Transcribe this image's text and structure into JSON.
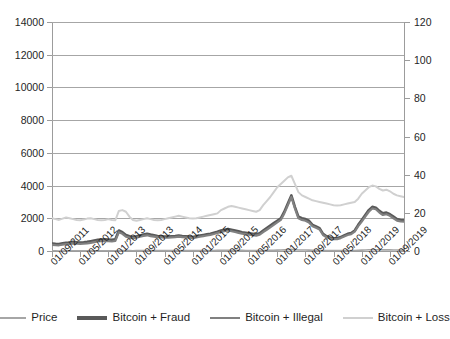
{
  "chart_data": {
    "type": "line",
    "title": "",
    "xlabel": "",
    "ylabel": "",
    "grid": true,
    "legend_position": "bottom",
    "y_left": {
      "label": "",
      "ylim": [
        0,
        14000
      ],
      "ticks": [
        0,
        2000,
        4000,
        6000,
        8000,
        10000,
        12000,
        14000
      ],
      "tick_labels": [
        "0",
        "2000",
        "4000",
        "6000",
        "8000",
        "10000",
        "12000",
        "14000"
      ]
    },
    "y_right": {
      "label": "",
      "ylim": [
        0,
        120
      ],
      "ticks": [
        0,
        20,
        40,
        60,
        80,
        100,
        120
      ],
      "tick_labels": [
        "0",
        "20",
        "40",
        "60",
        "80",
        "100",
        "120"
      ]
    },
    "x_tick_labels": [
      "01/09/2011",
      "01/05/2012",
      "01/01/2013",
      "01/09/2013",
      "01/05/2014",
      "01/01/2015",
      "01/09/2015",
      "01/05/2016",
      "01/01/2017",
      "01/09/2017",
      "01/05/2018",
      "01/01/2019",
      "01/09/2019"
    ],
    "x_tick_months": [
      0,
      8,
      16,
      24,
      32,
      40,
      48,
      56,
      64,
      72,
      80,
      88,
      96
    ],
    "x_range_months": [
      0,
      100
    ],
    "series": [
      {
        "name": "Price",
        "axis": "left",
        "color": "#a6a6a6",
        "width": 1.6,
        "x": [
          0,
          1,
          2,
          3,
          4,
          5,
          6,
          7,
          8,
          9,
          10,
          11,
          12,
          13,
          14,
          15,
          16,
          17,
          18,
          19,
          20,
          21,
          22,
          23,
          24,
          25,
          26,
          27,
          28,
          29,
          30,
          31,
          32,
          33,
          34,
          35,
          36,
          37,
          38,
          39,
          40,
          41,
          42,
          43,
          44,
          45,
          46,
          47,
          48,
          49,
          50,
          51,
          52,
          53,
          54,
          55,
          56,
          57,
          58,
          59,
          60,
          61,
          62,
          63,
          64,
          65,
          66,
          67,
          68,
          69,
          70,
          71,
          72,
          73,
          74,
          75,
          76,
          77,
          78,
          79,
          80,
          81,
          82,
          83,
          84,
          85,
          86,
          87,
          88,
          89,
          90,
          91,
          92,
          93,
          94,
          95,
          96,
          97,
          98,
          99,
          100
        ],
        "values": [
          5,
          5,
          4,
          4,
          5,
          6,
          7,
          6,
          6,
          6,
          7,
          8,
          9,
          10,
          11,
          12,
          12,
          11,
          13,
          30,
          35,
          25,
          22,
          18,
          20,
          24,
          28,
          30,
          26,
          24,
          22,
          21,
          20,
          20,
          22,
          23,
          25,
          23,
          22,
          21,
          20,
          22,
          24,
          26,
          28,
          30,
          33,
          36,
          40,
          42,
          44,
          42,
          40,
          38,
          36,
          34,
          32,
          30,
          28,
          30,
          35,
          40,
          45,
          50,
          55,
          60,
          70,
          85,
          100,
          80,
          62,
          60,
          58,
          55,
          48,
          44,
          40,
          30,
          25,
          22,
          20,
          20,
          22,
          25,
          28,
          30,
          35,
          45,
          55,
          65,
          75,
          80,
          78,
          72,
          68,
          70,
          66,
          62,
          58,
          56,
          55
        ]
      },
      {
        "name": "Bitcoin + Fraud",
        "axis": "left",
        "color": "#595959",
        "width": 2.6,
        "x": [
          0,
          1,
          2,
          3,
          4,
          5,
          6,
          7,
          8,
          9,
          10,
          11,
          12,
          13,
          14,
          15,
          16,
          17,
          18,
          19,
          20,
          21,
          22,
          23,
          24,
          25,
          26,
          27,
          28,
          29,
          30,
          31,
          32,
          33,
          34,
          35,
          36,
          37,
          38,
          39,
          40,
          41,
          42,
          43,
          44,
          45,
          46,
          47,
          48,
          49,
          50,
          51,
          52,
          53,
          54,
          55,
          56,
          57,
          58,
          59,
          60,
          61,
          62,
          63,
          64,
          65,
          66,
          67,
          68,
          69,
          70,
          71,
          72,
          73,
          74,
          75,
          76,
          77,
          78,
          79,
          80,
          81,
          82,
          83,
          84,
          85,
          86,
          87,
          88,
          89,
          90,
          91,
          92,
          93,
          94,
          95,
          96,
          97,
          98,
          99,
          100
        ],
        "values": [
          460,
          440,
          430,
          470,
          500,
          520,
          560,
          540,
          520,
          530,
          560,
          600,
          640,
          680,
          700,
          720,
          700,
          680,
          720,
          1250,
          1150,
          980,
          900,
          860,
          900,
          950,
          1000,
          1050,
          1000,
          960,
          920,
          900,
          880,
          880,
          900,
          920,
          950,
          920,
          900,
          880,
          860,
          900,
          940,
          980,
          1020,
          1060,
          1120,
          1180,
          1250,
          1300,
          1350,
          1300,
          1250,
          1200,
          1150,
          1120,
          1080,
          1050,
          1020,
          1080,
          1250,
          1400,
          1550,
          1700,
          1850,
          2000,
          2400,
          2900,
          3400,
          2700,
          2100,
          2000,
          1950,
          1850,
          1600,
          1500,
          1400,
          1050,
          900,
          820,
          780,
          780,
          850,
          950,
          1050,
          1100,
          1250,
          1600,
          1900,
          2200,
          2500,
          2700,
          2650,
          2450,
          2300,
          2350,
          2250,
          2100,
          1950,
          1900,
          1880
        ]
      },
      {
        "name": "Bitcoin + Illegal",
        "axis": "left",
        "color": "#808080",
        "width": 2.2,
        "x": [
          0,
          1,
          2,
          3,
          4,
          5,
          6,
          7,
          8,
          9,
          10,
          11,
          12,
          13,
          14,
          15,
          16,
          17,
          18,
          19,
          20,
          21,
          22,
          23,
          24,
          25,
          26,
          27,
          28,
          29,
          30,
          31,
          32,
          33,
          34,
          35,
          36,
          37,
          38,
          39,
          40,
          41,
          42,
          43,
          44,
          45,
          46,
          47,
          48,
          49,
          50,
          51,
          52,
          53,
          54,
          55,
          56,
          57,
          58,
          59,
          60,
          61,
          62,
          63,
          64,
          65,
          66,
          67,
          68,
          69,
          70,
          71,
          72,
          73,
          74,
          75,
          76,
          77,
          78,
          79,
          80,
          81,
          82,
          83,
          84,
          85,
          86,
          87,
          88,
          89,
          90,
          91,
          92,
          93,
          94,
          95,
          96,
          97,
          98,
          99,
          100
        ],
        "values": [
          380,
          360,
          350,
          390,
          420,
          440,
          470,
          450,
          440,
          450,
          470,
          500,
          540,
          580,
          600,
          620,
          600,
          580,
          620,
          1150,
          1050,
          880,
          820,
          780,
          820,
          870,
          920,
          960,
          910,
          880,
          850,
          830,
          810,
          810,
          830,
          850,
          880,
          850,
          830,
          810,
          790,
          830,
          870,
          910,
          950,
          990,
          1040,
          1100,
          1160,
          1210,
          1260,
          1210,
          1160,
          1110,
          1060,
          1030,
          1000,
          970,
          940,
          1000,
          1160,
          1300,
          1450,
          1600,
          1750,
          1900,
          2300,
          2800,
          3300,
          2600,
          2000,
          1900,
          1850,
          1750,
          1520,
          1420,
          1320,
          980,
          840,
          760,
          720,
          720,
          790,
          890,
          980,
          1030,
          1180,
          1520,
          1800,
          2100,
          2400,
          2600,
          2550,
          2350,
          2200,
          2250,
          2150,
          2000,
          1860,
          1810,
          1790
        ]
      },
      {
        "name": "Bitcoin + Loss",
        "axis": "left",
        "color": "#d0d0d0",
        "width": 2.0,
        "x": [
          0,
          1,
          2,
          3,
          4,
          5,
          6,
          7,
          8,
          9,
          10,
          11,
          12,
          13,
          14,
          15,
          16,
          17,
          18,
          19,
          20,
          21,
          22,
          23,
          24,
          25,
          26,
          27,
          28,
          29,
          30,
          31,
          32,
          33,
          34,
          35,
          36,
          37,
          38,
          39,
          40,
          41,
          42,
          43,
          44,
          45,
          46,
          47,
          48,
          49,
          50,
          51,
          52,
          53,
          54,
          55,
          56,
          57,
          58,
          59,
          60,
          61,
          62,
          63,
          64,
          65,
          66,
          67,
          68,
          69,
          70,
          71,
          72,
          73,
          74,
          75,
          76,
          77,
          78,
          79,
          80,
          81,
          82,
          83,
          84,
          85,
          86,
          87,
          88,
          89,
          90,
          91,
          92,
          93,
          94,
          95,
          96,
          97,
          98,
          99,
          100
        ],
        "values": [
          2000,
          1950,
          1900,
          1980,
          2050,
          2000,
          1950,
          1900,
          1880,
          1920,
          1980,
          2000,
          1950,
          1900,
          1880,
          1900,
          1950,
          1900,
          1880,
          2450,
          2500,
          2400,
          2100,
          1900,
          1850,
          1900,
          1950,
          2000,
          1950,
          1900,
          1880,
          1900,
          1950,
          2000,
          2050,
          2100,
          2150,
          2100,
          2050,
          2000,
          1980,
          2000,
          2050,
          2100,
          2150,
          2200,
          2250,
          2300,
          2500,
          2600,
          2700,
          2750,
          2700,
          2650,
          2600,
          2550,
          2500,
          2450,
          2400,
          2500,
          2800,
          3050,
          3300,
          3600,
          3900,
          4100,
          4300,
          4500,
          4600,
          4100,
          3600,
          3400,
          3300,
          3200,
          3100,
          3050,
          3000,
          2950,
          2900,
          2850,
          2800,
          2780,
          2800,
          2850,
          2900,
          2950,
          3000,
          3200,
          3500,
          3700,
          3900,
          4000,
          3950,
          3800,
          3700,
          3750,
          3650,
          3500,
          3400,
          3350,
          3300
        ]
      }
    ]
  },
  "legend": {
    "items": [
      {
        "label": "Price",
        "color": "#a6a6a6"
      },
      {
        "label": "Bitcoin + Fraud",
        "color": "#595959"
      },
      {
        "label": "Bitcoin + Illegal",
        "color": "#808080"
      },
      {
        "label": "Bitcoin + Loss",
        "color": "#d0d0d0"
      }
    ]
  }
}
